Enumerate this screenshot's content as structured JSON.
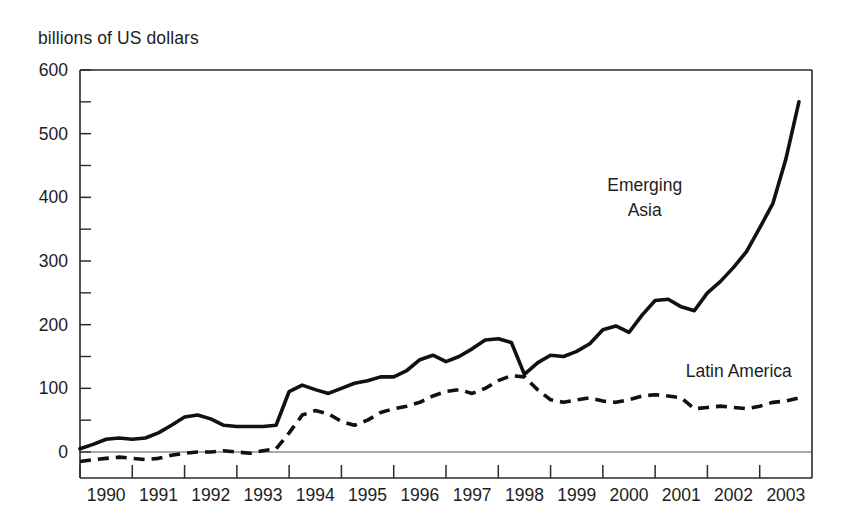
{
  "chart_data": {
    "type": "line",
    "title": "",
    "ylabel": "billions of US dollars",
    "xlabel": "",
    "ylim": [
      0,
      600
    ],
    "yticks": [
      0,
      100,
      200,
      300,
      400,
      500,
      600
    ],
    "yticks_minor": [
      50,
      150,
      250,
      350,
      450,
      550
    ],
    "xlim": [
      1989.5,
      2003.5
    ],
    "xticks": [
      1990,
      1991,
      1992,
      1993,
      1994,
      1995,
      1996,
      1997,
      1998,
      1999,
      2000,
      2001,
      2002,
      2003
    ],
    "xtick_labels": [
      "1990",
      "1991",
      "1992",
      "1993",
      "1994",
      "1995",
      "1996",
      "1997",
      "1998",
      "1999",
      "2000",
      "2001",
      "2002",
      "2003"
    ],
    "grid": false,
    "legend_position": "inline-annotation",
    "x": [
      1989.5,
      1989.75,
      1990.0,
      1990.25,
      1990.5,
      1990.75,
      1991.0,
      1991.25,
      1991.5,
      1991.75,
      1992.0,
      1992.25,
      1992.5,
      1992.75,
      1993.0,
      1993.25,
      1993.5,
      1993.75,
      1994.0,
      1994.25,
      1994.5,
      1994.75,
      1995.0,
      1995.25,
      1995.5,
      1995.75,
      1996.0,
      1996.25,
      1996.5,
      1996.75,
      1997.0,
      1997.25,
      1997.5,
      1997.75,
      1998.0,
      1998.25,
      1998.5,
      1998.75,
      1999.0,
      1999.25,
      1999.5,
      1999.75,
      2000.0,
      2000.25,
      2000.5,
      2000.75,
      2001.0,
      2001.25,
      2001.5,
      2001.75,
      2002.0,
      2002.25,
      2002.5,
      2002.75,
      2003.0,
      2003.25
    ],
    "series": [
      {
        "name": "Emerging Asia",
        "style": "solid",
        "label_text": [
          "Emerging",
          "Asia"
        ],
        "values": [
          5,
          12,
          20,
          22,
          20,
          22,
          30,
          42,
          55,
          58,
          52,
          42,
          40,
          40,
          40,
          42,
          95,
          105,
          98,
          92,
          100,
          108,
          112,
          118,
          118,
          128,
          145,
          152,
          142,
          150,
          162,
          176,
          178,
          172,
          122,
          140,
          152,
          150,
          158,
          170,
          192,
          198,
          188,
          215,
          238,
          240,
          228,
          222,
          250,
          268,
          290,
          315,
          352,
          390,
          460,
          550
        ]
      },
      {
        "name": "Latin America",
        "style": "dashed",
        "label_text": [
          "Latin America"
        ],
        "values": [
          -15,
          -12,
          -10,
          -8,
          -10,
          -12,
          -10,
          -5,
          -2,
          0,
          0,
          2,
          0,
          -2,
          2,
          5,
          30,
          58,
          65,
          60,
          48,
          42,
          50,
          62,
          68,
          72,
          78,
          88,
          95,
          98,
          92,
          100,
          112,
          120,
          118,
          98,
          82,
          78,
          82,
          85,
          80,
          78,
          82,
          88,
          90,
          88,
          85,
          68,
          70,
          72,
          70,
          68,
          72,
          78,
          80,
          85
        ]
      }
    ],
    "annotations": [
      {
        "text": "Emerging Asia",
        "x": 2000.3,
        "y": 410
      },
      {
        "text": "Latin America",
        "x": 2002.1,
        "y": 118
      }
    ]
  }
}
